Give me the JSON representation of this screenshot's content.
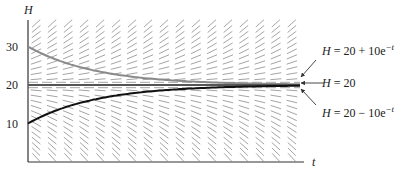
{
  "chart_data": {
    "type": "line",
    "title": "",
    "xlabel": "t",
    "ylabel": "H",
    "ylim": [
      0,
      36
    ],
    "yticks": [
      10,
      20,
      30
    ],
    "ytick_labels": [
      "10",
      "20",
      "30"
    ],
    "grid": false,
    "slope_field": {
      "equation": "dH/dt = -(H - 20)",
      "description": "Slope field with short dashed segments"
    },
    "series": [
      {
        "name": "H = 20 + 10e^{-t}",
        "color": "#888888",
        "H0": 30,
        "asymptote": 20
      },
      {
        "name": "H = 20",
        "color": "#555555",
        "H0": 20,
        "asymptote": 20
      },
      {
        "name": "H = 20 - 10e^{-t}",
        "color": "#111111",
        "H0": 10,
        "asymptote": 20
      }
    ],
    "annotations": [
      {
        "text": "H = 20 + 10e^{-t}",
        "target": "upper curve"
      },
      {
        "text": "H = 20",
        "target": "equilibrium line"
      },
      {
        "text": "H = 20 - 10e^{-t}",
        "target": "lower curve"
      }
    ]
  },
  "axes": {
    "y_label": "H",
    "x_label": "t",
    "ticks": [
      "30",
      "20",
      "10"
    ]
  },
  "labels": {
    "upper": {
      "H": "H",
      "eq": " = 20 + 10e",
      "exp": "−t"
    },
    "middle": {
      "H": "H",
      "eq": " = 20"
    },
    "lower": {
      "H": "H",
      "eq": " = 20 − 10e",
      "exp": "−t"
    }
  }
}
